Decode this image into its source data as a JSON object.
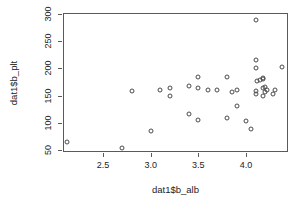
{
  "chart_data": {
    "type": "scatter",
    "title": "",
    "xlabel": "dat1$b_alb",
    "ylabel": "dat1$b_plt",
    "xlim": [
      2.08,
      4.44
    ],
    "ylim": [
      46,
      302
    ],
    "xticks": [
      2.5,
      3.0,
      3.5,
      4.0
    ],
    "xticklabels": [
      "2.5",
      "3.0",
      "3.5",
      "4.0"
    ],
    "yticks": [
      50,
      100,
      150,
      200,
      250,
      300
    ],
    "yticklabels": [
      "50",
      "100",
      "150",
      "200",
      "250",
      "300"
    ],
    "grid": false,
    "legend": null,
    "marker": "open-circle",
    "marker_color": "#4a4a4a",
    "box": true,
    "n_points": 38,
    "x": [
      2.12,
      2.7,
      2.8,
      3.0,
      3.1,
      3.2,
      3.2,
      3.4,
      3.4,
      3.5,
      3.5,
      3.5,
      3.6,
      3.7,
      3.8,
      3.8,
      3.85,
      3.9,
      3.9,
      4.0,
      4.05,
      4.1,
      4.1,
      4.1,
      4.1,
      4.1,
      4.12,
      4.15,
      4.18,
      4.18,
      4.18,
      4.18,
      4.2,
      4.2,
      4.22,
      4.28,
      4.3,
      4.38
    ],
    "y": [
      64,
      54,
      158,
      84,
      161,
      164,
      149,
      168,
      116,
      185,
      163,
      105,
      160,
      160,
      185,
      108,
      156,
      131,
      161,
      104,
      88,
      290,
      215,
      201,
      158,
      152,
      177,
      178,
      182,
      180,
      163,
      149,
      166,
      157,
      161,
      152,
      160,
      202
    ],
    "points": [
      {
        "x": 2.12,
        "y": 64
      },
      {
        "x": 2.7,
        "y": 54
      },
      {
        "x": 2.8,
        "y": 158
      },
      {
        "x": 3.0,
        "y": 84
      },
      {
        "x": 3.1,
        "y": 161
      },
      {
        "x": 3.2,
        "y": 164
      },
      {
        "x": 3.2,
        "y": 149
      },
      {
        "x": 3.4,
        "y": 168
      },
      {
        "x": 3.4,
        "y": 116
      },
      {
        "x": 3.5,
        "y": 185
      },
      {
        "x": 3.5,
        "y": 163
      },
      {
        "x": 3.5,
        "y": 105
      },
      {
        "x": 3.6,
        "y": 160
      },
      {
        "x": 3.7,
        "y": 160
      },
      {
        "x": 3.8,
        "y": 185
      },
      {
        "x": 3.8,
        "y": 108
      },
      {
        "x": 3.85,
        "y": 156
      },
      {
        "x": 3.9,
        "y": 131
      },
      {
        "x": 3.9,
        "y": 161
      },
      {
        "x": 4.0,
        "y": 104
      },
      {
        "x": 4.05,
        "y": 88
      },
      {
        "x": 4.1,
        "y": 290
      },
      {
        "x": 4.1,
        "y": 215
      },
      {
        "x": 4.1,
        "y": 201
      },
      {
        "x": 4.1,
        "y": 158
      },
      {
        "x": 4.1,
        "y": 152
      },
      {
        "x": 4.12,
        "y": 177
      },
      {
        "x": 4.15,
        "y": 178
      },
      {
        "x": 4.18,
        "y": 182
      },
      {
        "x": 4.18,
        "y": 180
      },
      {
        "x": 4.18,
        "y": 163
      },
      {
        "x": 4.18,
        "y": 149
      },
      {
        "x": 4.2,
        "y": 166
      },
      {
        "x": 4.2,
        "y": 157
      },
      {
        "x": 4.22,
        "y": 161
      },
      {
        "x": 4.28,
        "y": 152
      },
      {
        "x": 4.3,
        "y": 160
      },
      {
        "x": 4.38,
        "y": 202
      }
    ]
  },
  "geometry": {
    "box": {
      "left": 63,
      "top": 13,
      "width": 225,
      "height": 139
    },
    "x_pixel_at_2_5": 107.3,
    "x_pixels_per_unit": 95.4,
    "y_pixel_at_300": 13,
    "y_pixels_per_unit": 0.5
  }
}
